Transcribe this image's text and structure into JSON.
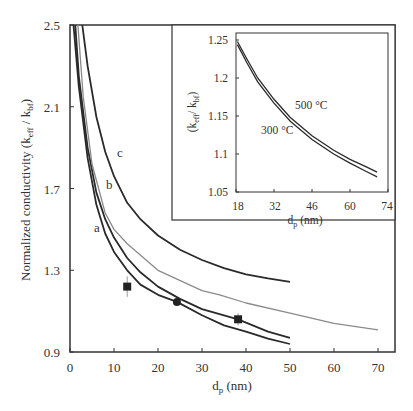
{
  "chart_data": [
    {
      "type": "line",
      "title": "",
      "xlabel": "d_p (nm)",
      "ylabel": "Normalized conductivity (k_eff / k_bf)",
      "xlim": [
        0,
        75
      ],
      "ylim": [
        0.9,
        2.5
      ],
      "x_ticks": [
        0,
        10,
        20,
        30,
        40,
        50,
        60,
        70
      ],
      "y_ticks": [
        0.9,
        1.3,
        1.7,
        2.1,
        2.5
      ],
      "grid": false,
      "series": [
        {
          "name": "a",
          "style": "dark",
          "points": [
            [
              0.8,
              2.5
            ],
            [
              2,
              2.2
            ],
            [
              4,
              1.85
            ],
            [
              6,
              1.62
            ],
            [
              8,
              1.48
            ],
            [
              10,
              1.39
            ],
            [
              13,
              1.3
            ],
            [
              16,
              1.23
            ],
            [
              20,
              1.18
            ],
            [
              24.3,
              1.145
            ],
            [
              30,
              1.08
            ],
            [
              35,
              1.03
            ],
            [
              40,
              1.0
            ],
            [
              45,
              0.965
            ],
            [
              50,
              0.939
            ]
          ]
        },
        {
          "name": "b",
          "style": "dark",
          "points": [
            [
              1.2,
              2.5
            ],
            [
              2,
              2.25
            ],
            [
              4,
              1.9
            ],
            [
              6,
              1.68
            ],
            [
              8,
              1.55
            ],
            [
              10,
              1.46
            ],
            [
              13,
              1.36
            ],
            [
              16,
              1.29
            ],
            [
              20,
              1.22
            ],
            [
              25,
              1.16
            ],
            [
              30,
              1.11
            ],
            [
              38.2,
              1.06
            ],
            [
              45,
              1.0
            ],
            [
              50,
              0.969
            ]
          ]
        },
        {
          "name": "unlabeled-gray",
          "style": "gray",
          "points": [
            [
              1.8,
              2.5
            ],
            [
              3,
              2.15
            ],
            [
              5,
              1.82
            ],
            [
              8,
              1.58
            ],
            [
              10,
              1.5
            ],
            [
              13,
              1.43
            ],
            [
              20,
              1.3
            ],
            [
              30,
              1.2
            ],
            [
              34,
              1.18
            ],
            [
              40,
              1.14
            ],
            [
              50,
              1.09
            ],
            [
              60,
              1.04
            ],
            [
              70,
              1.008
            ]
          ]
        },
        {
          "name": "c",
          "style": "dark",
          "points": [
            [
              2.8,
              2.5
            ],
            [
              4,
              2.3
            ],
            [
              6,
              2.05
            ],
            [
              8,
              1.88
            ],
            [
              10,
              1.76
            ],
            [
              13,
              1.63
            ],
            [
              16,
              1.55
            ],
            [
              20,
              1.47
            ],
            [
              25,
              1.4
            ],
            [
              30,
              1.35
            ],
            [
              35,
              1.31
            ],
            [
              40,
              1.28
            ],
            [
              45,
              1.26
            ],
            [
              50,
              1.243
            ]
          ]
        }
      ],
      "markers": [
        {
          "shape": "square",
          "x": 13,
          "y": 1.22,
          "error": 0.05
        },
        {
          "shape": "circle",
          "x": 24.3,
          "y": 1.145
        },
        {
          "shape": "square",
          "x": 38.2,
          "y": 1.06,
          "error": 0.03
        }
      ],
      "annotations": [
        {
          "text": "a",
          "x": 6.1,
          "y": 1.5
        },
        {
          "text": "b",
          "x": 9.1,
          "y": 1.72
        },
        {
          "text": "c",
          "x": 11.8,
          "y": 1.93
        }
      ]
    },
    {
      "type": "line",
      "title": "inset",
      "xlabel": "d_p (nm)",
      "ylabel": "(k_eff / k_bf)",
      "xlim": [
        18,
        74
      ],
      "ylim": [
        1.05,
        1.25
      ],
      "x_ticks": [
        18,
        32,
        46,
        60,
        74
      ],
      "y_ticks": [
        1.05,
        1.1,
        1.15,
        1.2,
        1.25
      ],
      "series": [
        {
          "name": "500 °C",
          "points": [
            [
              18.5,
              1.248
            ],
            [
              22,
              1.225
            ],
            [
              26,
              1.2
            ],
            [
              32,
              1.172
            ],
            [
              38,
              1.148
            ],
            [
              46,
              1.124
            ],
            [
              54,
              1.105
            ],
            [
              60,
              1.093
            ],
            [
              66,
              1.083
            ],
            [
              70,
              1.076
            ]
          ]
        },
        {
          "name": "300 °C",
          "points": [
            [
              18.5,
              1.244
            ],
            [
              22,
              1.22
            ],
            [
              26,
              1.195
            ],
            [
              32,
              1.167
            ],
            [
              38,
              1.143
            ],
            [
              46,
              1.119
            ],
            [
              54,
              1.1
            ],
            [
              60,
              1.088
            ],
            [
              66,
              1.077
            ],
            [
              70,
              1.07
            ]
          ]
        }
      ],
      "annotations": [
        {
          "text": "500 °C",
          "x": 44,
          "y": 1.165
        },
        {
          "text": "300 °C",
          "x": 36,
          "y": 1.135
        }
      ]
    }
  ],
  "labels": {
    "main_ylabel_prefix": "Normalized conductivity (k",
    "main_ylabel_sub1": "eff",
    "main_ylabel_mid": " / k",
    "main_ylabel_sub2": "bf",
    "main_ylabel_suffix": ")",
    "main_xlabel_prefix": "d",
    "main_xlabel_sub": "p",
    "main_xlabel_suffix": " (nm)",
    "inset_ylabel_prefix": "(k",
    "inset_ylabel_sub1": "eff",
    "inset_ylabel_mid": "/ k",
    "inset_ylabel_sub2": "bf",
    "inset_ylabel_suffix": ")",
    "inset_xlabel_prefix": "d",
    "inset_xlabel_sub": "p",
    "inset_xlabel_suffix": " (nm)",
    "main_x_ticks": [
      "0",
      "10",
      "20",
      "30",
      "40",
      "50",
      "60",
      "70"
    ],
    "main_y_ticks": [
      "0.9",
      "1.3",
      "1.7",
      "2.1",
      "2.5"
    ],
    "inset_x_ticks": [
      "18",
      "32",
      "46",
      "60",
      "74"
    ],
    "inset_y_ticks": [
      "1.05",
      "1.1",
      "1.15",
      "1.2",
      "1.25"
    ],
    "curve_a": "a",
    "curve_b": "b",
    "curve_c": "c",
    "inset_500": "500 °C",
    "inset_300": "300 °C"
  },
  "colors": {
    "dark_curve": "#2a2a2a",
    "gray_curve": "#8a8a8a",
    "axis": "#333333"
  }
}
